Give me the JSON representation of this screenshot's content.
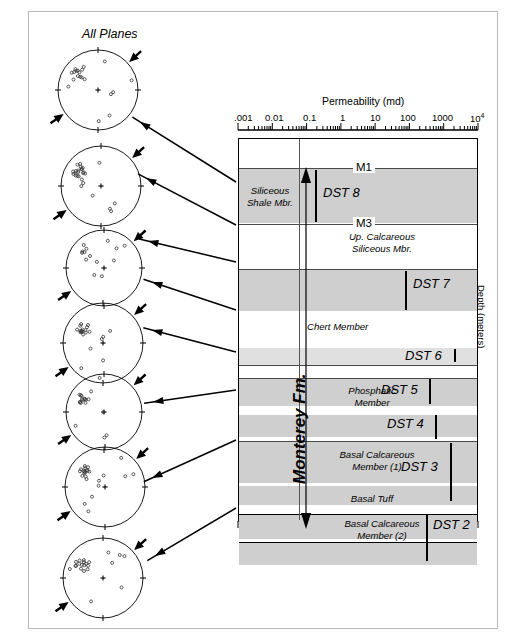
{
  "figure": {
    "stereonet_title": "All Planes",
    "axis_top_title": "Permeability (md)",
    "axis_right_title": "Depth (meters)"
  },
  "permeability_axis": {
    "type": "log",
    "ticks": [
      ".001",
      "0.01",
      "0.1",
      "1",
      "10",
      "100",
      "1000",
      "10"
    ],
    "last_exponent": "4",
    "decades": 7
  },
  "markers": [
    {
      "label": "M1"
    },
    {
      "label": "M3"
    }
  ],
  "formation": {
    "name": "Monterey Fm."
  },
  "members": [
    {
      "label_line1": "Siliceous",
      "label_line2": "Shale Mbr.",
      "id": "siliceous-shale"
    },
    {
      "label_line1": "Up. Calcareous",
      "label_line2": "Siliceous Mbr.",
      "id": "up-calcareous-siliceous"
    },
    {
      "label_line1": "Chert Member",
      "label_line2": "",
      "id": "chert"
    },
    {
      "label_line1": "Phosphatic",
      "label_line2": "Member",
      "id": "phosphatic"
    },
    {
      "label_line1": "Basal Calcareous",
      "label_line2": "Member (1)",
      "id": "basal-calcareous-1"
    },
    {
      "label_line1": "Basal Tuff",
      "label_line2": "",
      "id": "basal-tuff"
    },
    {
      "label_line1": "Basal Calcareous",
      "label_line2": "Member (2)",
      "id": "basal-calcareous-2"
    }
  ],
  "dst_tests": [
    {
      "label": "DST 8"
    },
    {
      "label": "DST 7"
    },
    {
      "label": "DST 6"
    },
    {
      "label": "DST 5"
    },
    {
      "label": "DST 4"
    },
    {
      "label": "DST 3"
    },
    {
      "label": "DST 2"
    }
  ],
  "stereonets": [
    {
      "index": 1
    },
    {
      "index": 2
    },
    {
      "index": 3
    },
    {
      "index": 4
    },
    {
      "index": 5
    },
    {
      "index": 6
    },
    {
      "index": 7
    },
    {
      "index": 8
    }
  ],
  "chart_data": {
    "type": "table",
    "xlabel": "Permeability (md)",
    "ylabel": "Depth (meters)",
    "xscale": "log",
    "xlim": [
      0.001,
      10000
    ],
    "xticks": [
      0.001,
      0.01,
      0.1,
      1,
      10,
      100,
      1000,
      10000
    ],
    "xticklabels": [
      ".001",
      "0.01",
      "0.1",
      "1",
      "10",
      "100",
      "1000",
      "10^4"
    ],
    "grid": false,
    "legend": "none",
    "annotations": [
      "M1",
      "M3",
      "Monterey Fm.",
      "All Planes"
    ],
    "categories": [
      "DST 8",
      "DST 7",
      "DST 6",
      "DST 5",
      "DST 4",
      "DST 3",
      "DST 2"
    ],
    "series": [
      {
        "name": "DST permeability marker (md)",
        "values": [
          0.2,
          30,
          100,
          60,
          60,
          200,
          300
        ]
      }
    ],
    "units": {
      "permeability": "md",
      "depth": "meters"
    }
  }
}
